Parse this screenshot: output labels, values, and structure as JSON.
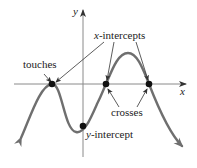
{
  "axes": {
    "x_label": "x",
    "y_label": "y"
  },
  "labels": {
    "x_intercepts_var": "x",
    "x_intercepts_rest": "-intercepts",
    "touches": "touches",
    "crosses": "crosses",
    "y_intercept_var": "y",
    "y_intercept_rest": "-intercept"
  },
  "points": {
    "touch_point": {
      "x": 52,
      "y": 84
    },
    "cross_point_1": {
      "x": 106,
      "y": 84
    },
    "cross_point_2": {
      "x": 149,
      "y": 84
    },
    "y_intercept_point": {
      "x": 83,
      "y": 126
    }
  },
  "colors": {
    "curve": "#6f6f6f",
    "axis": "#8a8a8a",
    "text": "#222222",
    "point": "#111111",
    "pointer": "#333333"
  }
}
